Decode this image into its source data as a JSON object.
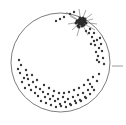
{
  "figure": {
    "title": "",
    "background_color": "#ffffff",
    "width": 126,
    "height": 125
  },
  "chart_data": {
    "type": "scatter",
    "title": "",
    "subtitle": "",
    "xlabel": "",
    "ylabel": "",
    "xlim": [
      0,
      126
    ],
    "ylim": [
      0,
      125
    ],
    "grid": false,
    "legend": null,
    "tick_labels": [],
    "annotations": [],
    "boundary": {
      "name": "circle-outline",
      "shape": "circle",
      "cx": 60.5,
      "cy": 62.5,
      "r": 49.5,
      "stroke": "#6e6e6e",
      "stroke_width": 0.9,
      "fill": "none"
    },
    "axis_tick": {
      "name": "right-edge-tick",
      "x1": 112,
      "y1": 66,
      "x2": 123,
      "y2": 66,
      "stroke": "#9a9a9a",
      "stroke_width": 1
    },
    "cluster": {
      "name": "starburst-cluster",
      "cx": 81,
      "cy": 22,
      "color": "#2b2b2b",
      "spoke_color": "#555555",
      "spokes": [
        [
          81,
          22,
          66,
          12
        ],
        [
          81,
          22,
          70,
          16
        ],
        [
          81,
          22,
          72,
          30
        ],
        [
          81,
          22,
          77,
          36
        ],
        [
          81,
          22,
          88,
          35
        ],
        [
          81,
          22,
          95,
          30
        ],
        [
          81,
          22,
          97,
          24
        ],
        [
          81,
          22,
          92,
          14
        ],
        [
          81,
          22,
          86,
          10
        ],
        [
          81,
          22,
          79,
          9
        ],
        [
          81,
          22,
          68,
          24
        ],
        [
          81,
          22,
          93,
          19
        ]
      ],
      "core_points": [
        [
          79,
          20
        ],
        [
          81,
          19
        ],
        [
          83,
          20
        ],
        [
          78,
          22
        ],
        [
          80,
          22
        ],
        [
          82,
          22
        ],
        [
          84,
          22
        ],
        [
          79,
          24
        ],
        [
          81,
          24
        ],
        [
          83,
          24
        ],
        [
          77,
          21
        ],
        [
          85,
          21
        ],
        [
          80,
          18
        ],
        [
          82,
          26
        ],
        [
          78,
          26
        ],
        [
          84,
          25
        ],
        [
          76,
          23
        ],
        [
          86,
          23
        ],
        [
          81,
          21
        ],
        [
          83,
          18
        ],
        [
          79,
          27
        ],
        [
          85,
          19
        ]
      ]
    },
    "points": {
      "color": "#3a3a3a",
      "size": 1.2,
      "coords": [
        [
          64,
          17
        ],
        [
          70,
          14
        ],
        [
          74,
          12
        ],
        [
          60,
          19
        ],
        [
          56,
          21
        ],
        [
          90,
          29
        ],
        [
          94,
          33
        ],
        [
          92,
          37
        ],
        [
          97,
          40
        ],
        [
          95,
          45
        ],
        [
          99,
          48
        ],
        [
          96,
          52
        ],
        [
          101,
          44
        ],
        [
          98,
          56
        ],
        [
          102,
          51
        ],
        [
          94,
          41
        ],
        [
          89,
          33
        ],
        [
          86,
          31
        ],
        [
          91,
          44
        ],
        [
          100,
          38
        ],
        [
          103,
          58
        ],
        [
          99,
          62
        ],
        [
          104,
          64
        ],
        [
          97,
          60
        ],
        [
          20,
          73
        ],
        [
          24,
          78
        ],
        [
          18,
          69
        ],
        [
          27,
          75
        ],
        [
          22,
          82
        ],
        [
          29,
          85
        ],
        [
          25,
          88
        ],
        [
          33,
          82
        ],
        [
          31,
          90
        ],
        [
          36,
          87
        ],
        [
          28,
          79
        ],
        [
          35,
          93
        ],
        [
          40,
          89
        ],
        [
          38,
          96
        ],
        [
          43,
          92
        ],
        [
          45,
          97
        ],
        [
          41,
          101
        ],
        [
          48,
          94
        ],
        [
          50,
          99
        ],
        [
          46,
          103
        ],
        [
          53,
          96
        ],
        [
          55,
          101
        ],
        [
          51,
          105
        ],
        [
          58,
          99
        ],
        [
          60,
          104
        ],
        [
          56,
          107
        ],
        [
          63,
          97
        ],
        [
          65,
          102
        ],
        [
          61,
          106
        ],
        [
          68,
          99
        ],
        [
          70,
          104
        ],
        [
          66,
          107
        ],
        [
          73,
          97
        ],
        [
          75,
          101
        ],
        [
          71,
          105
        ],
        [
          78,
          95
        ],
        [
          80,
          100
        ],
        [
          76,
          103
        ],
        [
          83,
          93
        ],
        [
          85,
          97
        ],
        [
          81,
          101
        ],
        [
          88,
          90
        ],
        [
          90,
          94
        ],
        [
          86,
          98
        ],
        [
          92,
          87
        ],
        [
          94,
          90
        ],
        [
          90,
          84
        ],
        [
          97,
          81
        ],
        [
          93,
          77
        ],
        [
          99,
          74
        ],
        [
          44,
          85
        ],
        [
          49,
          88
        ],
        [
          54,
          91
        ],
        [
          59,
          93
        ],
        [
          64,
          93
        ],
        [
          37,
          80
        ],
        [
          32,
          75
        ],
        [
          26,
          70
        ],
        [
          21,
          65
        ],
        [
          19,
          60
        ],
        [
          69,
          92
        ],
        [
          74,
          90
        ],
        [
          79,
          88
        ],
        [
          84,
          85
        ],
        [
          88,
          80
        ]
      ]
    }
  }
}
